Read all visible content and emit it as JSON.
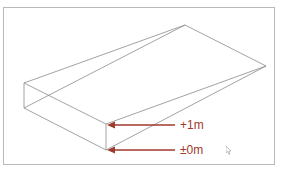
{
  "figure": {
    "labels": {
      "upper": "+1m",
      "lower": "±0m"
    },
    "caption": "",
    "colors": {
      "line": "#8a8a8e",
      "arrow": "#a03a2c",
      "frame": "#b9b9bd"
    }
  }
}
